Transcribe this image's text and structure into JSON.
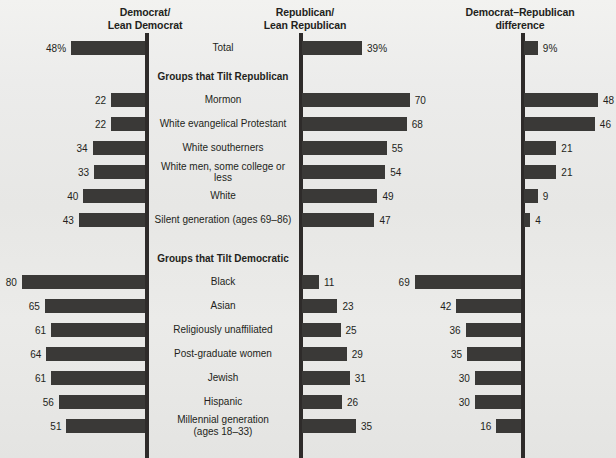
{
  "headers": {
    "democrat": "Democrat/\nLean Democrat",
    "democrat_line1": "Democrat/",
    "democrat_line2": "Lean Democrat",
    "republican_line1": "Republican/",
    "republican_line2": "Lean Republican",
    "difference_line1": "Democrat–Republican",
    "difference_line2": "difference"
  },
  "sections": {
    "republican_tilt": "Groups that Tilt Republican",
    "democratic_tilt": "Groups that Tilt Democratic"
  },
  "total_row": {
    "label": "Total",
    "dem": "48%",
    "rep": "39%",
    "diff": "9%"
  },
  "chart_data": {
    "type": "bar",
    "xlabel": "",
    "ylabel": "",
    "xlim": [
      0,
      80
    ],
    "grid": false,
    "legend": "none",
    "orientation": "horizontal",
    "panels": [
      {
        "name": "Democrat/Lean Democrat",
        "direction": "left"
      },
      {
        "name": "Republican/Lean Republican",
        "direction": "right"
      },
      {
        "name": "Democrat–Republican difference",
        "direction": "signed"
      }
    ],
    "categories": [
      "Total",
      "Mormon",
      "White evangelical Protestant",
      "White southerners",
      "White men, some college or less",
      "White",
      "Silent generation (ages 69–86)",
      "Black",
      "Asian",
      "Religiously unaffiliated",
      "Post-graduate women",
      "Jewish",
      "Hispanic",
      "Millennial generation (ages 18–33)"
    ],
    "series": [
      {
        "name": "Democrat/Lean Democrat",
        "values": [
          48,
          22,
          22,
          34,
          33,
          40,
          43,
          80,
          65,
          61,
          64,
          61,
          56,
          51
        ]
      },
      {
        "name": "Republican/Lean Republican",
        "values": [
          39,
          70,
          68,
          55,
          54,
          49,
          47,
          11,
          23,
          25,
          29,
          31,
          26,
          35
        ]
      },
      {
        "name": "Democrat–Republican difference",
        "values": [
          9,
          48,
          46,
          21,
          21,
          9,
          4,
          69,
          42,
          36,
          35,
          30,
          30,
          16
        ]
      }
    ]
  },
  "rows": [
    {
      "label": "Total",
      "label2": "",
      "dem": "48%",
      "rep": "39%",
      "diff": "9%",
      "dem_v": 48,
      "rep_v": 39,
      "diff_v": 9,
      "diff_dir": "right"
    },
    {
      "label": "Mormon",
      "label2": "",
      "dem": "22",
      "rep": "70",
      "diff": "48",
      "dem_v": 22,
      "rep_v": 70,
      "diff_v": 48,
      "diff_dir": "right"
    },
    {
      "label": "White evangelical Protestant",
      "label2": "",
      "dem": "22",
      "rep": "68",
      "diff": "46",
      "dem_v": 22,
      "rep_v": 68,
      "diff_v": 46,
      "diff_dir": "right"
    },
    {
      "label": "White southerners",
      "label2": "",
      "dem": "34",
      "rep": "55",
      "diff": "21",
      "dem_v": 34,
      "rep_v": 55,
      "diff_v": 21,
      "diff_dir": "right"
    },
    {
      "label": "White men, some college or less",
      "label2": "",
      "dem": "33",
      "rep": "54",
      "diff": "21",
      "dem_v": 33,
      "rep_v": 54,
      "diff_v": 21,
      "diff_dir": "right"
    },
    {
      "label": "White",
      "label2": "",
      "dem": "40",
      "rep": "49",
      "diff": "9",
      "dem_v": 40,
      "rep_v": 49,
      "diff_v": 9,
      "diff_dir": "right"
    },
    {
      "label": "Silent generation (ages 69–86)",
      "label2": "",
      "dem": "43",
      "rep": "47",
      "diff": "4",
      "dem_v": 43,
      "rep_v": 47,
      "diff_v": 4,
      "diff_dir": "right"
    },
    {
      "label": "Black",
      "label2": "",
      "dem": "80",
      "rep": "11",
      "diff": "69",
      "dem_v": 80,
      "rep_v": 11,
      "diff_v": 69,
      "diff_dir": "left"
    },
    {
      "label": "Asian",
      "label2": "",
      "dem": "65",
      "rep": "23",
      "diff": "42",
      "dem_v": 65,
      "rep_v": 23,
      "diff_v": 42,
      "diff_dir": "left"
    },
    {
      "label": "Religiously unaffiliated",
      "label2": "",
      "dem": "61",
      "rep": "25",
      "diff": "36",
      "dem_v": 61,
      "rep_v": 25,
      "diff_v": 36,
      "diff_dir": "left"
    },
    {
      "label": "Post-graduate women",
      "label2": "",
      "dem": "64",
      "rep": "29",
      "diff": "35",
      "dem_v": 64,
      "rep_v": 29,
      "diff_v": 35,
      "diff_dir": "left"
    },
    {
      "label": "Jewish",
      "label2": "",
      "dem": "61",
      "rep": "31",
      "diff": "30",
      "dem_v": 61,
      "rep_v": 31,
      "diff_v": 30,
      "diff_dir": "left"
    },
    {
      "label": "Hispanic",
      "label2": "",
      "dem": "56",
      "rep": "26",
      "diff": "30",
      "dem_v": 56,
      "rep_v": 26,
      "diff_v": 30,
      "diff_dir": "left"
    },
    {
      "label": "Millennial generation",
      "label2": "(ages 18–33)",
      "dem": "51",
      "rep": "35",
      "diff": "16",
      "dem_v": 51,
      "rep_v": 35,
      "diff_v": 16,
      "diff_dir": "left"
    }
  ]
}
